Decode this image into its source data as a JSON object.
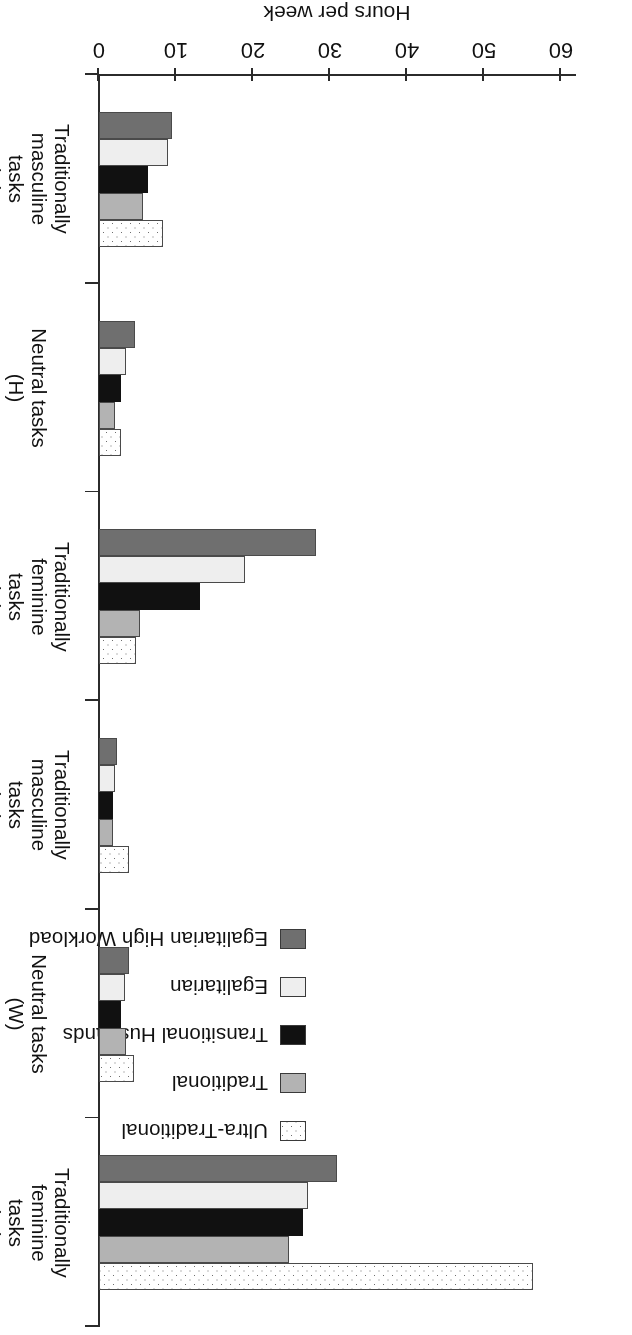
{
  "chart_data": {
    "type": "bar",
    "orientation": "horizontal",
    "title": "",
    "xlabel": "",
    "ylabel": "Hours per week",
    "value_axis_title": "Hours per week",
    "ylim": [
      0,
      60
    ],
    "ticks": [
      0,
      10,
      20,
      30,
      40,
      50,
      60
    ],
    "grid": false,
    "legend_position": "top-left",
    "categories": [
      "Traditionally feminine tasks (W)",
      "Neutral tasks (W)",
      "Traditionally masculine tasks (W)",
      "Traditionally feminine tasks (H)",
      "Neutral tasks (H)",
      "Traditionally masculine tasks (H)"
    ],
    "category_lines": [
      [
        "Traditionally",
        "feminine tasks",
        "(W)"
      ],
      [
        "Neutral tasks",
        "(W)"
      ],
      [
        "Traditionally",
        "masculine tasks",
        "(W)"
      ],
      [
        "Traditionally",
        "feminine tasks",
        "(H)"
      ],
      [
        "Neutral tasks",
        "(H)"
      ],
      [
        "Traditionally",
        "masculine tasks",
        "(H)"
      ]
    ],
    "series": [
      {
        "name": "Ultra-Traditional",
        "fill": "dotted",
        "color": "#ffffff",
        "values": [
          56.4,
          4.5,
          3.9,
          4.8,
          2.9,
          8.3
        ]
      },
      {
        "name": "Traditional",
        "fill": "lightgray",
        "color": "#b3b3b3",
        "values": [
          24.7,
          3.5,
          1.8,
          5.3,
          2.1,
          5.7
        ]
      },
      {
        "name": "Transitional Husbands",
        "fill": "black",
        "color": "#111111",
        "values": [
          26.5,
          2.9,
          1.8,
          13.1,
          2.9,
          6.4
        ]
      },
      {
        "name": "Egalitarian",
        "fill": "palest",
        "color": "#eeeeee",
        "values": [
          27.1,
          3.4,
          2.1,
          19.0,
          3.5,
          9.0
        ]
      },
      {
        "name": "Egalitarian High Workload",
        "fill": "darkgray",
        "color": "#6f6f6f",
        "values": [
          30.9,
          3.9,
          2.3,
          28.2,
          4.7,
          9.5
        ]
      }
    ]
  },
  "legend": {
    "items": [
      {
        "label": "Ultra-Traditional",
        "fill": "dotted"
      },
      {
        "label": "Traditional",
        "fill": "lightgray"
      },
      {
        "label": "Transitional Husbands",
        "fill": "black"
      },
      {
        "label": "Egalitarian",
        "fill": "palest"
      },
      {
        "label": "Egalitarian High Workload",
        "fill": "darkgray"
      }
    ]
  },
  "axis": {
    "value_title": "Hours per week",
    "tick_labels": [
      "0",
      "10",
      "20",
      "30",
      "40",
      "50",
      "60"
    ]
  }
}
